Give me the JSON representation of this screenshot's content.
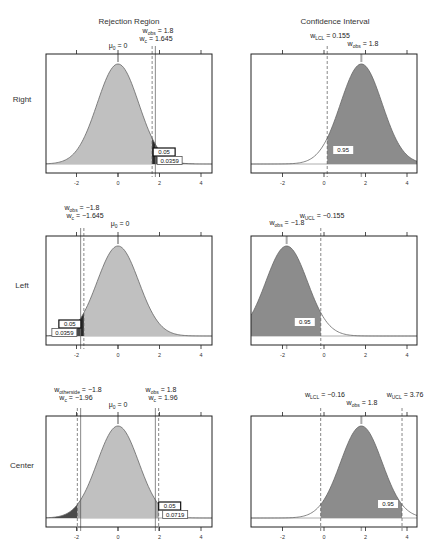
{
  "figure": {
    "column_titles": [
      "Rejection Region",
      "Confidence Interval"
    ],
    "row_labels": [
      "Right",
      "Left",
      "Center"
    ],
    "x_ticks": [
      -2,
      0,
      2,
      4
    ],
    "x_tick_labels": [
      "-2",
      "0",
      "2",
      "4"
    ],
    "colors": {
      "light_fill": "#c0c0c0",
      "dark_fill": "#8c8c8c",
      "critical_fill": "#2a2a2a",
      "pvalue_fill": "#4a4a4a",
      "curve": "#666666",
      "frame": "#222222"
    }
  },
  "chart_data": [
    {
      "id": "rejection-right",
      "type": "area",
      "title": "Rejection Region",
      "row": "Right",
      "distribution": "normal(0,1)",
      "xlim": [
        -3.5,
        4.5
      ],
      "annotations": {
        "mu0": {
          "label": "μ",
          "sub": "0",
          "rest": " = 0",
          "x": 0
        },
        "wobs": {
          "label": "w",
          "sub": "obs",
          "rest": " = 1.8",
          "x": 1.8
        },
        "wc": {
          "label": "w",
          "sub": "c",
          "rest": " = 1.645",
          "x": 1.645
        }
      },
      "alpha_label": "0.05",
      "pvalue_label": "0.0359",
      "alpha": 0.05,
      "p_value": 0.0359,
      "tail": "right"
    },
    {
      "id": "ci-right",
      "type": "area",
      "title": "Confidence Interval",
      "row": "Right",
      "distribution": "normal(1.8,1)",
      "xlim": [
        -3.5,
        4.5
      ],
      "annotations": {
        "wlcl": {
          "label": "w",
          "sub": "LCL",
          "rest": " = 0.155",
          "x": 0.155
        },
        "wobs": {
          "label": "w",
          "sub": "obs",
          "rest": " = 1.8",
          "x": 1.8
        }
      },
      "conf_label": "0.95",
      "confidence": 0.95
    },
    {
      "id": "rejection-left",
      "type": "area",
      "title": "Rejection Region",
      "row": "Left",
      "distribution": "normal(0,1)",
      "xlim": [
        -3.5,
        4.5
      ],
      "annotations": {
        "wobs": {
          "label": "w",
          "sub": "obs",
          "rest": " = −1.8",
          "x": -1.8
        },
        "wc": {
          "label": "w",
          "sub": "c",
          "rest": " = −1.645",
          "x": -1.645
        },
        "mu0": {
          "label": "μ",
          "sub": "0",
          "rest": " = 0",
          "x": 0
        }
      },
      "alpha_label": "0.05",
      "pvalue_label": "0.0359",
      "alpha": 0.05,
      "p_value": 0.0359,
      "tail": "left"
    },
    {
      "id": "ci-left",
      "type": "area",
      "title": "Confidence Interval",
      "row": "Left",
      "distribution": "normal(-1.8,1)",
      "xlim": [
        -3.5,
        4.5
      ],
      "annotations": {
        "wucl": {
          "label": "w",
          "sub": "UCL",
          "rest": " = −0.155",
          "x": -0.155
        },
        "wobs": {
          "label": "w",
          "sub": "obs",
          "rest": " = −1.8",
          "x": -1.8
        }
      },
      "conf_label": "0.95",
      "confidence": 0.95
    },
    {
      "id": "rejection-center",
      "type": "area",
      "title": "Rejection Region",
      "row": "Center",
      "distribution": "normal(0,1)",
      "xlim": [
        -3.5,
        4.5
      ],
      "annotations": {
        "wotherside": {
          "label": "w",
          "sub": "otherside",
          "rest": " = −1.8",
          "x": -1.8
        },
        "wcl": {
          "label": "w",
          "sub": "c",
          "rest": " = −1.96",
          "x": -1.96
        },
        "mu0": {
          "label": "μ",
          "sub": "0",
          "rest": " = 0",
          "x": 0
        },
        "wobs": {
          "label": "w",
          "sub": "obs",
          "rest": " = 1.8",
          "x": 1.8
        },
        "wcr": {
          "label": "w",
          "sub": "c",
          "rest": " = 1.96",
          "x": 1.96
        }
      },
      "alpha_label": "0.05",
      "pvalue_label": "0.0719",
      "alpha": 0.05,
      "p_value": 0.0719,
      "tail": "two-sided"
    },
    {
      "id": "ci-center",
      "type": "area",
      "title": "Confidence Interval",
      "row": "Center",
      "distribution": "normal(1.8,1)",
      "xlim": [
        -3.5,
        4.5
      ],
      "annotations": {
        "wlcl": {
          "label": "w",
          "sub": "LCL",
          "rest": " = −0.16",
          "x": -0.16
        },
        "wobs": {
          "label": "w",
          "sub": "obs",
          "rest": " = 1.8",
          "x": 1.8
        },
        "wucl": {
          "label": "w",
          "sub": "UCL",
          "rest": " = 3.76",
          "x": 3.76
        }
      },
      "conf_label": "0.95",
      "confidence": 0.95
    }
  ]
}
